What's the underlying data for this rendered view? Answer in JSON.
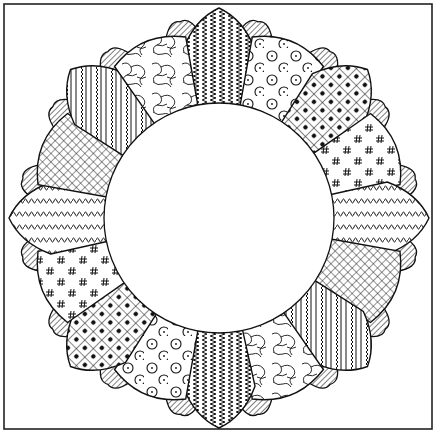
{
  "artwork": {
    "title": "Dresden Plate quilt block",
    "style": "black ink line drawing",
    "ink_color": "#111111",
    "paper_color": "#ffffff"
  },
  "frame": {
    "x": 4,
    "y": 4,
    "width": 428,
    "height": 425
  },
  "center_circle": {
    "cx": 219,
    "cy": 218,
    "r": 115,
    "fill": "#ffffff"
  },
  "blade_geometry": {
    "large_blade_count": 16,
    "small_blade_count": 16,
    "pointed_tip_radius": 210,
    "rounded_tip_radius": 196,
    "small_blade_radius": 200
  },
  "large_blades": [
    {
      "angle": -90,
      "tip": "pointed",
      "pattern": "zigzag-stripes"
    },
    {
      "angle": -67.5,
      "tip": "rounded",
      "pattern": "circles-dots"
    },
    {
      "angle": -45,
      "tip": "pointed",
      "pattern": "checker-dots"
    },
    {
      "angle": -22.5,
      "tip": "rounded",
      "pattern": "hash-marks"
    },
    {
      "angle": 0,
      "tip": "pointed",
      "pattern": "squiggle-rows"
    },
    {
      "angle": 22.5,
      "tip": "rounded",
      "pattern": "crosshatch"
    },
    {
      "angle": 45,
      "tip": "pointed",
      "pattern": "stripes-squiggle"
    },
    {
      "angle": 67.5,
      "tip": "rounded",
      "pattern": "marble"
    },
    {
      "angle": 90,
      "tip": "pointed",
      "pattern": "zigzag-stripes"
    },
    {
      "angle": 112.5,
      "tip": "rounded",
      "pattern": "circles-dots"
    },
    {
      "angle": 135,
      "tip": "pointed",
      "pattern": "checker-dots"
    },
    {
      "angle": 157.5,
      "tip": "rounded",
      "pattern": "hash-marks"
    },
    {
      "angle": 180,
      "tip": "pointed",
      "pattern": "squiggle-rows"
    },
    {
      "angle": 202.5,
      "tip": "rounded",
      "pattern": "crosshatch"
    },
    {
      "angle": 225,
      "tip": "pointed",
      "pattern": "stripes-squiggle"
    },
    {
      "angle": 247.5,
      "tip": "rounded",
      "pattern": "marble"
    }
  ],
  "small_blades": {
    "pattern": "diagonal-lines"
  }
}
